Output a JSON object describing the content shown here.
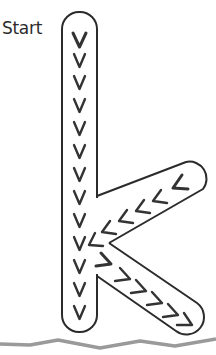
{
  "worksheet": {
    "start_label": "Start",
    "letter": "k",
    "colors": {
      "outline": "#2b2b2b",
      "arrows": "#333333",
      "ground": "#9a9a9a",
      "background": "#ffffff"
    },
    "strokes": [
      {
        "name": "stem",
        "direction": "down",
        "arrow_glyph": "V",
        "arrow_count": 14
      },
      {
        "name": "upper-arm",
        "direction": "down-left",
        "arrow_glyph": "<",
        "arrow_count": 6
      },
      {
        "name": "lower-arm",
        "direction": "down-right",
        "arrow_glyph": ">",
        "arrow_count": 6
      }
    ]
  }
}
